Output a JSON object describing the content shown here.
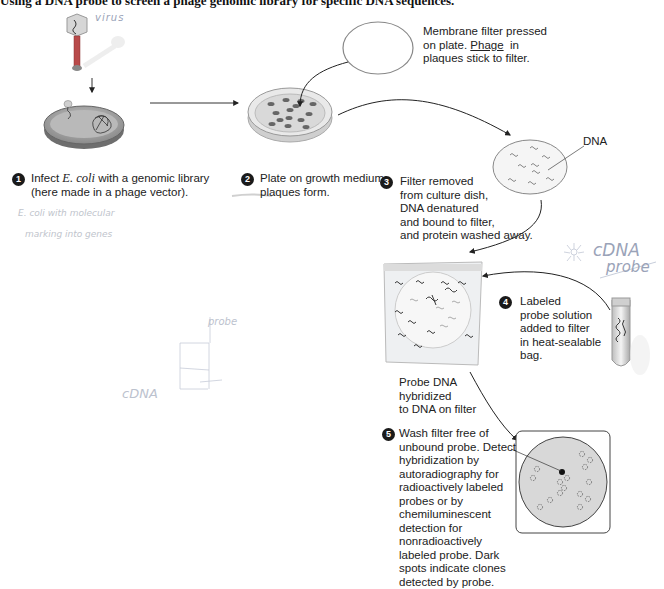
{
  "title": "Using a DNA probe to screen a phage genomic library for specific DNA sequences.",
  "steps": [
    {
      "number": "1",
      "text_prefix": "Infect ",
      "text_italic": "E. coli",
      "text_suffix": " with a genomic library",
      "text_line2": "(here made in a phage vector)."
    },
    {
      "number": "2",
      "line1": "Plate on growth medium;",
      "line2": "plaques form."
    },
    {
      "number": "3",
      "lines": [
        "Filter removed",
        "from culture dish,",
        "DNA denatured",
        "and bound to filter,",
        "and protein washed away."
      ]
    },
    {
      "number": "4",
      "lines": [
        "Labeled",
        "probe solution",
        "added to filter",
        "in heat-sealable",
        "bag."
      ]
    },
    {
      "number": "5",
      "lines": [
        "Wash filter free of",
        "unbound probe. Detect",
        "hybridization by",
        "autoradiography for",
        "radioactively labeled",
        "probes or by",
        "chemiluminescent",
        "detection for",
        "nonradioactively",
        "labeled probe. Dark",
        "spots indicate clones",
        "detected by probe."
      ]
    }
  ],
  "captions": {
    "membrane": {
      "line1": "Membrane filter pressed",
      "line2_prefix": "on plate. ",
      "line2_underlined": "Phage",
      "line2_suffix": "  in",
      "line3": "plaques stick to filter."
    },
    "dna_label": "DNA",
    "hybridized": [
      "Probe DNA",
      "hybridized",
      "to DNA on filter"
    ]
  },
  "handwritten_notes": {
    "virus": "virus",
    "ecoli_note_line1": "E. coli with molecular",
    "ecoli_note_line2": "marking into genes",
    "cdna_probe_line1": "cDNA",
    "cdna_probe_line2": "probe",
    "probe": "probe",
    "cdna": "cDNA"
  },
  "colors": {
    "ink": "#222222",
    "bacterium": "#9c9c9c",
    "plate": "#d8d8d8",
    "filter_gray": "#d9d9d9",
    "handwriting": "#9aa3b8"
  }
}
